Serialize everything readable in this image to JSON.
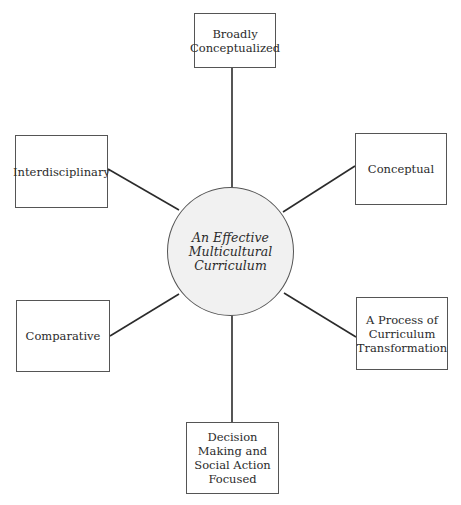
{
  "diagram": {
    "type": "hub-and-spoke concept map",
    "center": {
      "label": "An Effective Multicultural Curriculum"
    },
    "nodes": [
      {
        "id": "top",
        "label": "Broadly Conceptualized"
      },
      {
        "id": "upper-right",
        "label": "Conceptual"
      },
      {
        "id": "lower-right",
        "label": "A Process of Curriculum Transformation"
      },
      {
        "id": "bottom",
        "label": "Decision Making and Social Action Focused"
      },
      {
        "id": "lower-left",
        "label": "Comparative"
      },
      {
        "id": "upper-left",
        "label": "Interdisciplinary"
      }
    ],
    "colors": {
      "line": "#2b2b2b",
      "hub_fill": "#f1f1f1",
      "box_border": "#555555"
    }
  }
}
